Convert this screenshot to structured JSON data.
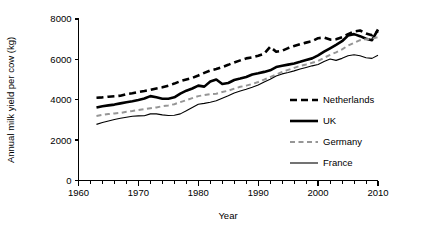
{
  "chart_data": {
    "type": "line",
    "title": "",
    "xlabel": "Year",
    "ylabel": "Annual milk yield per cow (kg)",
    "xlim": [
      1960,
      2010
    ],
    "ylim": [
      0,
      8000
    ],
    "xticks": [
      1960,
      1970,
      1980,
      1990,
      2000,
      2010
    ],
    "xtick_labels": [
      "1960",
      "1970",
      "1980",
      "1990",
      "2000",
      "2010"
    ],
    "xminor_step": 2,
    "yticks": [
      0,
      2000,
      4000,
      6000,
      8000
    ],
    "ytick_labels": [
      "0",
      "2000",
      "4000",
      "6000",
      "8000"
    ],
    "grid": false,
    "legend_position": "center-right",
    "x": [
      1963,
      1964,
      1965,
      1966,
      1967,
      1968,
      1969,
      1970,
      1971,
      1972,
      1973,
      1974,
      1975,
      1976,
      1977,
      1978,
      1979,
      1980,
      1981,
      1982,
      1983,
      1984,
      1985,
      1986,
      1987,
      1988,
      1989,
      1990,
      1991,
      1992,
      1993,
      1994,
      1995,
      1996,
      1997,
      1998,
      1999,
      2000,
      2001,
      2002,
      2003,
      2004,
      2005,
      2006,
      2007,
      2008,
      2009,
      2010
    ],
    "series": [
      {
        "name": "Netherlands",
        "style": "dashed",
        "color": "#000000",
        "width": 2.6,
        "dash": "7,4",
        "values": [
          4100,
          4120,
          4150,
          4170,
          4200,
          4280,
          4320,
          4380,
          4430,
          4490,
          4560,
          4620,
          4700,
          4800,
          4920,
          5000,
          5080,
          5200,
          5330,
          5450,
          5520,
          5620,
          5730,
          5850,
          5950,
          6050,
          6100,
          6180,
          6280,
          6620,
          6380,
          6430,
          6560,
          6660,
          6750,
          6830,
          6900,
          7050,
          7080,
          6980,
          7000,
          7100,
          7250,
          7380,
          7430,
          7280,
          7200,
          7400
        ]
      },
      {
        "name": "UK",
        "style": "solid",
        "color": "#000000",
        "width": 2.6,
        "dash": "none",
        "values": [
          3620,
          3680,
          3720,
          3760,
          3820,
          3880,
          3930,
          3990,
          4060,
          4180,
          4120,
          4050,
          4050,
          4120,
          4300,
          4450,
          4560,
          4700,
          4650,
          4900,
          5000,
          4780,
          4830,
          4980,
          5050,
          5130,
          5250,
          5310,
          5380,
          5460,
          5620,
          5680,
          5740,
          5800,
          5880,
          5970,
          6050,
          6200,
          6380,
          6550,
          6720,
          6900,
          7180,
          7250,
          7150,
          7020,
          6950,
          7480
        ]
      },
      {
        "name": "Germany",
        "style": "dashed",
        "color": "#969696",
        "width": 2.0,
        "dash": "5,3.5",
        "values": [
          3200,
          3250,
          3290,
          3320,
          3350,
          3400,
          3440,
          3490,
          3530,
          3580,
          3620,
          3680,
          3720,
          3780,
          3880,
          3980,
          4080,
          4180,
          4230,
          4280,
          4300,
          4380,
          4450,
          4550,
          4640,
          4700,
          4780,
          4880,
          5000,
          5120,
          5250,
          5380,
          5480,
          5580,
          5680,
          5750,
          5830,
          5920,
          6080,
          6220,
          6350,
          6500,
          6680,
          6820,
          6950,
          7000,
          7020,
          7100
        ]
      },
      {
        "name": "France",
        "style": "solid",
        "color": "#000000",
        "width": 1.1,
        "dash": "none",
        "values": [
          2780,
          2870,
          2950,
          3020,
          3080,
          3130,
          3180,
          3200,
          3210,
          3300,
          3300,
          3250,
          3220,
          3230,
          3300,
          3450,
          3620,
          3780,
          3820,
          3880,
          3950,
          4080,
          4200,
          4330,
          4430,
          4520,
          4620,
          4730,
          4880,
          5020,
          5180,
          5280,
          5350,
          5430,
          5520,
          5600,
          5680,
          5750,
          5900,
          6020,
          5950,
          6050,
          6180,
          6230,
          6180,
          6080,
          6050,
          6200
        ]
      }
    ],
    "legend": [
      {
        "label": "Netherlands",
        "style": "dashed",
        "color": "#000000",
        "width": 2.6,
        "dash": "7,4"
      },
      {
        "label": "UK",
        "style": "solid",
        "color": "#000000",
        "width": 2.6,
        "dash": "none"
      },
      {
        "label": "Germany",
        "style": "dashed",
        "color": "#969696",
        "width": 2.0,
        "dash": "5,3.5"
      },
      {
        "label": "France",
        "style": "solid",
        "color": "#000000",
        "width": 1.1,
        "dash": "none"
      }
    ]
  }
}
